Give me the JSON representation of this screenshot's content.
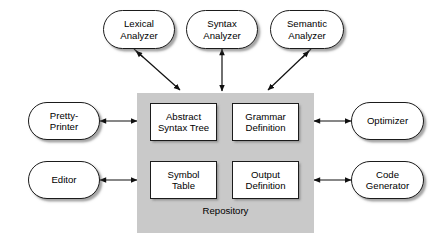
{
  "diagram": {
    "style": {
      "panel_fill": "#c9c9c9",
      "node_fill": "#ffffff",
      "stroke": "#1b1b1b",
      "background": "#ffffff",
      "shadow": "#5a5a5a"
    },
    "repository": {
      "label": "Repository",
      "stores": [
        {
          "id": "abstract-syntax-tree",
          "line1": "Abstract",
          "line2": "Syntax Tree"
        },
        {
          "id": "grammar-definition",
          "line1": "Grammar",
          "line2": "Definition"
        },
        {
          "id": "symbol-table",
          "line1": "Symbol",
          "line2": "Table"
        },
        {
          "id": "output-definition",
          "line1": "Output",
          "line2": "Definition"
        }
      ]
    },
    "components": {
      "top": [
        {
          "id": "lexical-analyzer",
          "line1": "Lexical",
          "line2": "Analyzer"
        },
        {
          "id": "syntax-analyzer",
          "line1": "Syntax",
          "line2": "Analyzer"
        },
        {
          "id": "semantic-analyzer",
          "line1": "Semantic",
          "line2": "Analyzer"
        }
      ],
      "left": [
        {
          "id": "pretty-printer",
          "line1": "Pretty-",
          "line2": "Printer"
        },
        {
          "id": "editor",
          "line1": "Editor",
          "line2": ""
        }
      ],
      "right": [
        {
          "id": "optimizer",
          "line1": "Optimizer",
          "line2": ""
        },
        {
          "id": "code-generator",
          "line1": "Code",
          "line2": "Generator"
        }
      ]
    },
    "connections": [
      {
        "from": "lexical-analyzer",
        "to": "repository",
        "kind": "arrow-single-diagonal"
      },
      {
        "from": "syntax-analyzer",
        "to": "repository",
        "kind": "arrow-double-vertical"
      },
      {
        "from": "semantic-analyzer",
        "to": "repository",
        "kind": "arrow-single-diagonal"
      },
      {
        "from": "pretty-printer",
        "to": "repository",
        "kind": "arrow-double-horizontal"
      },
      {
        "from": "editor",
        "to": "repository",
        "kind": "arrow-double-horizontal"
      },
      {
        "from": "repository",
        "to": "optimizer",
        "kind": "arrow-double-horizontal"
      },
      {
        "from": "repository",
        "to": "code-generator",
        "kind": "arrow-double-horizontal"
      }
    ]
  }
}
